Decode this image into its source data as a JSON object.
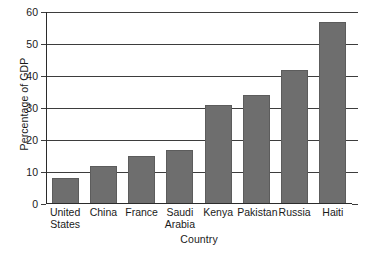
{
  "chart_data": {
    "type": "bar",
    "title": "",
    "xlabel": "Country",
    "ylabel": "Percentage of GDP",
    "categories": [
      "United States",
      "China",
      "France",
      "Saudi Arabia",
      "Kenya",
      "Pakistan",
      "Russia",
      "Haiti"
    ],
    "category_lines": [
      [
        "United",
        "States"
      ],
      [
        "China"
      ],
      [
        "France"
      ],
      [
        "Saudi",
        "Arabia"
      ],
      [
        "Kenya"
      ],
      [
        "Pakistan"
      ],
      [
        "Russia"
      ],
      [
        "Haiti"
      ]
    ],
    "values": [
      8,
      12,
      15,
      17,
      31,
      34,
      42,
      57
    ],
    "ylim": [
      0,
      60
    ],
    "yticks": [
      0,
      10,
      20,
      30,
      40,
      50,
      60
    ],
    "ytick_labels": [
      "0",
      "10",
      "20",
      "30",
      "40",
      "50",
      "60"
    ],
    "grid": true,
    "legend": "none",
    "bar_color": "#6e6e6e",
    "axis_color": "#2b2b2b",
    "grid_color": "#3d3d3d",
    "background": "#ffffff"
  }
}
